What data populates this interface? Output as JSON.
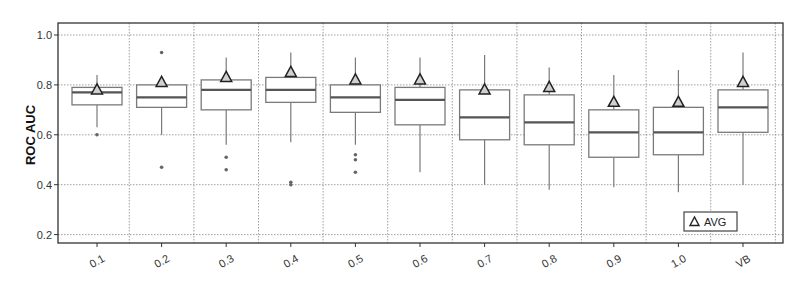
{
  "chart_data": {
    "type": "box",
    "title": "",
    "xlabel": "",
    "ylabel": "ROC AUC",
    "ylim": [
      0.17,
      1.05
    ],
    "yticks": [
      0.2,
      0.4,
      0.6,
      0.8,
      1.0
    ],
    "ytick_labels": [
      "0.2",
      "0.4",
      "0.6",
      "0.8",
      "1.0"
    ],
    "grid": true,
    "legend": {
      "position": "lower right",
      "entries": [
        {
          "marker": "triangle",
          "label": "AVG"
        }
      ]
    },
    "categories": [
      "0.1",
      "0.2",
      "0.3",
      "0.4",
      "0.5",
      "0.6",
      "0.7",
      "0.8",
      "0.9",
      "1.0",
      "VB"
    ],
    "series": [
      {
        "name": "0.1",
        "whisker_low": 0.63,
        "q1": 0.72,
        "median": 0.77,
        "q3": 0.79,
        "whisker_high": 0.84,
        "avg": 0.78,
        "outliers": [
          0.6
        ]
      },
      {
        "name": "0.2",
        "whisker_low": 0.6,
        "q1": 0.71,
        "median": 0.75,
        "q3": 0.8,
        "whisker_high": 0.81,
        "avg": 0.81,
        "outliers": [
          0.93,
          0.47
        ]
      },
      {
        "name": "0.3",
        "whisker_low": 0.56,
        "q1": 0.7,
        "median": 0.78,
        "q3": 0.82,
        "whisker_high": 0.91,
        "avg": 0.83,
        "outliers": [
          0.51,
          0.46
        ]
      },
      {
        "name": "0.4",
        "whisker_low": 0.57,
        "q1": 0.73,
        "median": 0.78,
        "q3": 0.83,
        "whisker_high": 0.93,
        "avg": 0.85,
        "outliers": [
          0.41,
          0.4
        ]
      },
      {
        "name": "0.5",
        "whisker_low": 0.56,
        "q1": 0.69,
        "median": 0.75,
        "q3": 0.8,
        "whisker_high": 0.91,
        "avg": 0.82,
        "outliers": [
          0.52,
          0.5,
          0.45
        ]
      },
      {
        "name": "0.6",
        "whisker_low": 0.45,
        "q1": 0.64,
        "median": 0.74,
        "q3": 0.79,
        "whisker_high": 0.91,
        "avg": 0.82,
        "outliers": []
      },
      {
        "name": "0.7",
        "whisker_low": 0.4,
        "q1": 0.58,
        "median": 0.67,
        "q3": 0.78,
        "whisker_high": 0.92,
        "avg": 0.78,
        "outliers": []
      },
      {
        "name": "0.8",
        "whisker_low": 0.38,
        "q1": 0.56,
        "median": 0.65,
        "q3": 0.76,
        "whisker_high": 0.87,
        "avg": 0.79,
        "outliers": []
      },
      {
        "name": "0.9",
        "whisker_low": 0.39,
        "q1": 0.51,
        "median": 0.61,
        "q3": 0.7,
        "whisker_high": 0.84,
        "avg": 0.73,
        "outliers": []
      },
      {
        "name": "1.0",
        "whisker_low": 0.37,
        "q1": 0.52,
        "median": 0.61,
        "q3": 0.71,
        "whisker_high": 0.86,
        "avg": 0.73,
        "outliers": []
      },
      {
        "name": "VB",
        "whisker_low": 0.4,
        "q1": 0.61,
        "median": 0.71,
        "q3": 0.78,
        "whisker_high": 0.93,
        "avg": 0.81,
        "outliers": []
      }
    ]
  },
  "colors": {
    "box_stroke": "#7a7a7a",
    "median": "#555555",
    "frame": "#333333",
    "grid": "#888888",
    "marker_fill": "#d0d0d0",
    "marker_stroke": "#222222",
    "outlier": "#666666"
  }
}
